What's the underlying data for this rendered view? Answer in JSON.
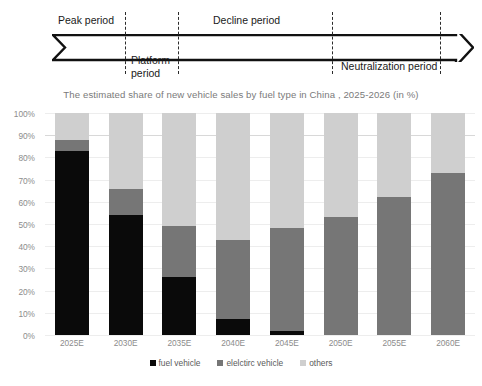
{
  "timeline": {
    "periods": [
      {
        "label": "Peak period",
        "x": 62,
        "y": 14,
        "align": "top"
      },
      {
        "label": "Platform\nperiod",
        "x": 130,
        "y": 56,
        "align": "bottom"
      },
      {
        "label": "Decline period",
        "x": 212,
        "y": 14,
        "align": "top"
      },
      {
        "label": "Neutralization period",
        "x": 340,
        "y": 60,
        "align": "bottom"
      }
    ],
    "dividers": [
      {
        "x": 125,
        "y": 12,
        "h": 62
      },
      {
        "x": 178,
        "y": 12,
        "h": 62
      },
      {
        "x": 332,
        "y": 12,
        "h": 62
      },
      {
        "x": 440,
        "y": 12,
        "h": 62
      }
    ],
    "arrow_color": "#111111"
  },
  "chart_data": {
    "type": "bar",
    "stacked": true,
    "title": "The estimated share of new vehicle sales by fuel type in China , 2025-2026 (in %)",
    "xlabel": "",
    "ylabel": "",
    "ylim": [
      0,
      100
    ],
    "grid": true,
    "legend_position": "bottom",
    "categories": [
      "2025E",
      "2030E",
      "2035E",
      "2040E",
      "2045E",
      "2050E",
      "2055E",
      "2060E"
    ],
    "ytick_labels": [
      "100%",
      "90%",
      "80%",
      "70%",
      "60%",
      "50%",
      "40%",
      "30%",
      "20%",
      "10%",
      "0%"
    ],
    "ytick_values": [
      100,
      90,
      80,
      70,
      60,
      50,
      40,
      30,
      20,
      10,
      0
    ],
    "series": [
      {
        "name": "fuel vehicle",
        "color": "#0a0a0a",
        "values": [
          83,
          54,
          26,
          7,
          2,
          0,
          0,
          0
        ]
      },
      {
        "name": "elelctirc vehicle",
        "color": "#767676",
        "values": [
          5,
          12,
          23,
          36,
          46,
          53,
          62,
          73
        ]
      },
      {
        "name": "others",
        "color": "#cfcfcf",
        "values": [
          12,
          34,
          51,
          57,
          52,
          47,
          38,
          27
        ]
      }
    ],
    "totals": [
      100,
      100,
      100,
      100,
      100,
      100,
      100,
      100
    ]
  }
}
